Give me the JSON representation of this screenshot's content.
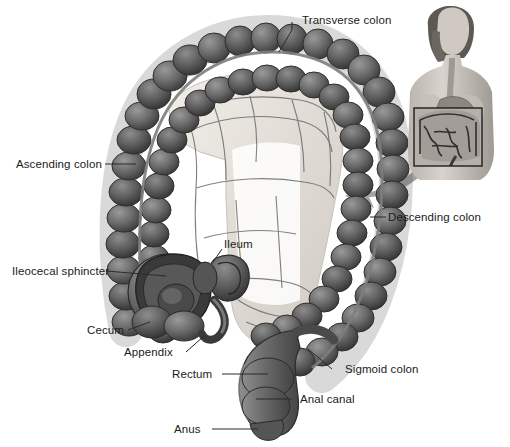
{
  "figure": {
    "background_color": "#ffffff",
    "label_color": "#1b1b1b",
    "leader_color": "#2b2b2b",
    "arrow_color": "#9a9a9a",
    "colon_dark": "#4a4a4a",
    "colon_mid": "#6d6d6d",
    "colon_light": "#8f8f8f",
    "mesentery_color": "#e6e2dc",
    "vessel_color": "#6b6b6b"
  },
  "labels": [
    {
      "id": "transverse-colon",
      "text": "Transverse colon",
      "x": 302,
      "y": 14
    },
    {
      "id": "ascending-colon",
      "text": "Ascending colon",
      "x": 16,
      "y": 158
    },
    {
      "id": "descending-colon",
      "text": "Descending colon",
      "x": 388,
      "y": 211
    },
    {
      "id": "ileum",
      "text": "Ileum",
      "x": 224,
      "y": 238
    },
    {
      "id": "ileocecal-sphincter",
      "text": "Ileocecal sphincter",
      "x": 12,
      "y": 265
    },
    {
      "id": "cecum",
      "text": "Cecum",
      "x": 87,
      "y": 324
    },
    {
      "id": "appendix",
      "text": "Appendix",
      "x": 124,
      "y": 346
    },
    {
      "id": "sigmoid-colon",
      "text": "Sigmoid colon",
      "x": 345,
      "y": 363
    },
    {
      "id": "rectum",
      "text": "Rectum",
      "x": 172,
      "y": 368
    },
    {
      "id": "anal-canal",
      "text": "Anal canal",
      "x": 300,
      "y": 393
    },
    {
      "id": "anus",
      "text": "Anus",
      "x": 174,
      "y": 423
    }
  ],
  "inset": {
    "name": "female-torso-inset",
    "description": "Female upper body showing esophagus, stomach and abdominal cavity",
    "box": {
      "x": 414,
      "y": 108,
      "width": 68,
      "height": 58
    }
  },
  "arrow": {
    "name": "pointer-arrow",
    "description": "Curved arrow from inset torso to colon illustration"
  }
}
